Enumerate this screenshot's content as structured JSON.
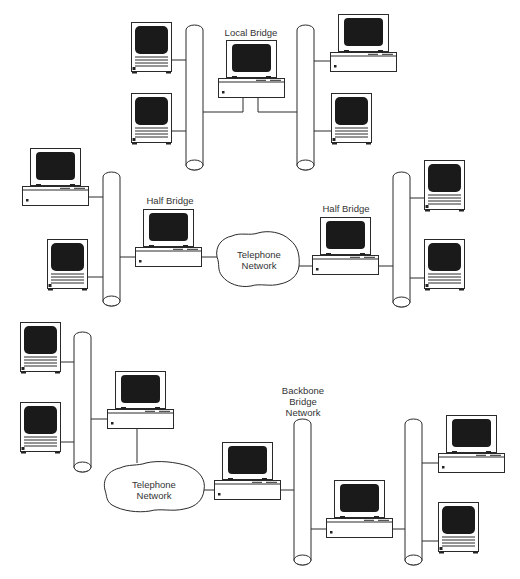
{
  "diagram": {
    "type": "network-bridge-configurations",
    "colors": {
      "line": "#2a2a2a",
      "screen": "#1a1a1a",
      "background": "#ffffff",
      "label": "#333333"
    },
    "sections": [
      {
        "name": "local-bridge",
        "labels": {
          "bridge": "Local Bridge"
        }
      },
      {
        "name": "remote-half-bridges",
        "labels": {
          "left_bridge": "Half Bridge",
          "right_bridge": "Half Bridge",
          "cloud_line1": "Telephone",
          "cloud_line2": "Network"
        }
      },
      {
        "name": "backbone-bridge",
        "labels": {
          "cloud_line1": "Telephone",
          "cloud_line2": "Network",
          "backbone_line1": "Backbone",
          "backbone_line2": "Bridge",
          "backbone_line3": "Network"
        }
      }
    ]
  }
}
